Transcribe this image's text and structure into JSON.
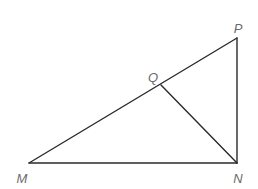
{
  "diagram": {
    "type": "geometry-triangle",
    "stroke_color": "#2a2a2a",
    "label_color": "#6b6b6b",
    "points": {
      "M": {
        "label": "M",
        "x": 29,
        "y": 163,
        "label_x": 22,
        "label_y": 178
      },
      "N": {
        "label": "N",
        "x": 237,
        "y": 163,
        "label_x": 238,
        "label_y": 178
      },
      "P": {
        "label": "P",
        "x": 237,
        "y": 38,
        "label_x": 238,
        "label_y": 28
      },
      "Q": {
        "label": "Q",
        "x": 161,
        "y": 85,
        "label_x": 153,
        "label_y": 77
      }
    },
    "segments": [
      {
        "from": "M",
        "to": "N"
      },
      {
        "from": "N",
        "to": "P"
      },
      {
        "from": "M",
        "to": "P"
      },
      {
        "from": "Q",
        "to": "N"
      }
    ]
  }
}
